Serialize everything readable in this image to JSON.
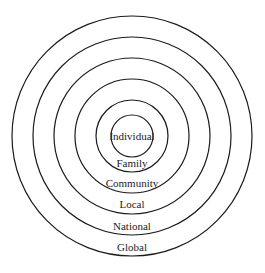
{
  "diagram": {
    "type": "concentric-circles",
    "center": [
      132,
      136
    ],
    "stroke_color": "#1a1a1a",
    "text_color": "#222222",
    "rings": [
      {
        "label": "Individual",
        "radius": 21,
        "label_y": 140
      },
      {
        "label": "Family",
        "radius": 36,
        "label_y": 167
      },
      {
        "label": "Community",
        "radius": 57,
        "label_y": 187
      },
      {
        "label": "Local",
        "radius": 78,
        "label_y": 208
      },
      {
        "label": "National",
        "radius": 99,
        "label_y": 230
      },
      {
        "label": "Global",
        "radius": 120,
        "label_y": 251
      }
    ]
  }
}
